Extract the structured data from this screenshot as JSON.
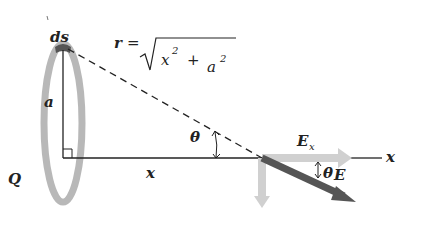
{
  "diagram": {
    "labels": {
      "ds": "ds",
      "r": "r",
      "equals": "=",
      "x_sq": "x",
      "two_1": "2",
      "plus": "+",
      "a_sq": "a",
      "two_2": "2",
      "a": "a",
      "theta_left": "θ",
      "x_axis_segment": "x",
      "Q": "Q",
      "E_x_main": "E",
      "E_x_sub": "x",
      "x_axis_end": "x",
      "theta_right": "θ",
      "E": "E"
    },
    "formula": "r = √(x² + a²)",
    "colors": {
      "ring": "#b8b8b8",
      "ring_element": "#555555",
      "lines": "#222222",
      "E_vector": "#555555",
      "E_components": "#d0d0d0"
    }
  }
}
